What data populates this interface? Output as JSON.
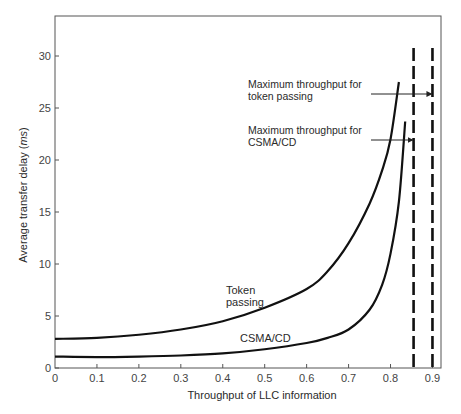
{
  "chart_data": {
    "type": "line",
    "title": "",
    "xlabel": "Throughput of LLC information",
    "ylabel_prefix": "Average transfer delay (",
    "ylabel_unit": "ms",
    "ylabel_suffix": ")",
    "xlim": [
      0,
      0.92
    ],
    "ylim": [
      0,
      33
    ],
    "grid": false,
    "legend": "none (curves labeled inline)",
    "x_ticks": [
      "0",
      "0.1",
      "0.2",
      "0.3",
      "0.4",
      "0.5",
      "0.6",
      "0.7",
      "0.8",
      "0.9"
    ],
    "x_tick_values": [
      0,
      0.1,
      0.2,
      0.3,
      0.4,
      0.5,
      0.6,
      0.7,
      0.8,
      0.9
    ],
    "y_ticks": [
      "0",
      "5",
      "10",
      "15",
      "20",
      "25",
      "30"
    ],
    "y_tick_values": [
      0,
      5,
      10,
      15,
      20,
      25,
      30
    ],
    "series": [
      {
        "name": "Token passing",
        "label_lines": [
          "Token",
          "passing"
        ],
        "x": [
          0,
          0.1,
          0.2,
          0.3,
          0.4,
          0.5,
          0.6,
          0.65,
          0.7,
          0.75,
          0.78,
          0.8,
          0.82
        ],
        "values": [
          2.8,
          2.9,
          3.2,
          3.7,
          4.5,
          5.8,
          7.6,
          9.3,
          12.0,
          15.8,
          19.0,
          22.0,
          27.5
        ]
      },
      {
        "name": "CSMA/CD",
        "label_lines": [
          "CSMA/CD"
        ],
        "x": [
          0,
          0.1,
          0.2,
          0.3,
          0.4,
          0.5,
          0.6,
          0.65,
          0.7,
          0.75,
          0.78,
          0.8,
          0.82,
          0.835
        ],
        "values": [
          1.1,
          1.05,
          1.1,
          1.2,
          1.4,
          1.8,
          2.4,
          2.9,
          3.7,
          5.6,
          8.0,
          11.0,
          16.0,
          23.7
        ]
      }
    ],
    "reference_lines": [
      {
        "x": 0.855,
        "style": "dashed",
        "name": "Maximum throughput for CSMA/CD"
      },
      {
        "x": 0.9,
        "style": "dashed",
        "name": "Maximum throughput for token passing"
      }
    ],
    "annotations": [
      {
        "lines": [
          "Maximum throughput for",
          "token passing"
        ],
        "arrow_to_x": 0.9
      },
      {
        "lines": [
          "Maximum throughput for",
          "CSMA/CD"
        ],
        "arrow_to_x": 0.855
      }
    ]
  }
}
